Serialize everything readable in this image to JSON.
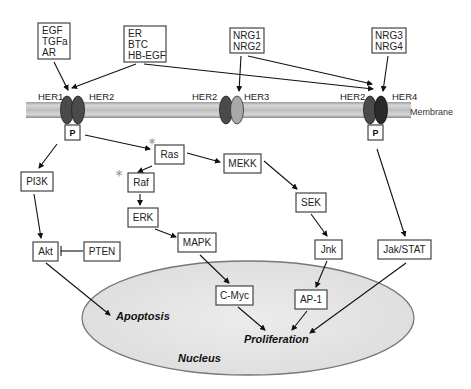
{
  "diagram": {
    "ligands": [
      {
        "id": "lig1",
        "lines": [
          "EGF",
          "TGFa",
          "AR"
        ]
      },
      {
        "id": "lig2",
        "lines": [
          "ER",
          "BTC",
          "HB-EGF"
        ]
      },
      {
        "id": "lig3",
        "lines": [
          "NRG1",
          "NRG2"
        ]
      },
      {
        "id": "lig4",
        "lines": [
          "NRG3",
          "NRG4"
        ]
      }
    ],
    "receptors": {
      "her1": "HER1",
      "her2_a": "HER2",
      "her2_b": "HER2",
      "her3": "HER3",
      "her2_c": "HER2",
      "her4": "HER4"
    },
    "membrane_label": "Membrane",
    "phospho_label": "P",
    "nodes": {
      "pi3k": "PI3K",
      "akt": "Akt",
      "pten": "PTEN",
      "ras": "Ras",
      "raf": "Raf",
      "erk": "ERK",
      "mapk": "MAPK",
      "mekk": "MEKK",
      "sek": "SEK",
      "jnk": "Jnk",
      "jakstat": "Jak/STAT",
      "cmyc": "C-Myc",
      "ap1": "AP-1"
    },
    "outcomes": {
      "apoptosis": "Apoptosis",
      "proliferation": "Proliferation"
    },
    "nucleus_label": "Nucleus",
    "mutation_marker": "*",
    "colors": {
      "membrane": "#c8c8c8",
      "receptor_dark": "#4a4a4a",
      "receptor_light": "#a8a8a8",
      "receptor_black": "#2a2a2a",
      "nucleus_fill": "#e6e6e6",
      "star": "#888888"
    }
  }
}
